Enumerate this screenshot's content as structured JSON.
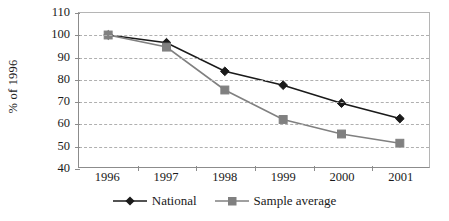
{
  "chart_data": {
    "type": "line",
    "title": "",
    "xlabel": "",
    "ylabel": "% of 1996",
    "categories": [
      "1996",
      "1997",
      "1998",
      "1999",
      "2000",
      "2001"
    ],
    "ylim": [
      40,
      110
    ],
    "ytick_step": 10,
    "yticks": [
      "110",
      "100",
      "90",
      "80",
      "70",
      "60",
      "50",
      "40"
    ],
    "grid": true,
    "legend_position": "bottom",
    "series": [
      {
        "name": "National",
        "marker": "diamond",
        "color": "#1a1a1a",
        "values": [
          100,
          96.5,
          83.5,
          77.2,
          69,
          62
        ]
      },
      {
        "name": "Sample average",
        "marker": "square",
        "color": "#808080",
        "values": [
          100,
          94.5,
          75,
          61.6,
          55,
          50.8
        ]
      }
    ]
  },
  "legend": {
    "items": [
      {
        "label": "National",
        "marker": "diamond-marker",
        "color": "#1a1a1a"
      },
      {
        "label": "Sample average",
        "marker": "square-marker",
        "color": "#808080"
      }
    ]
  },
  "colors": {
    "axis": "#8c8c8c",
    "grid": "#b0b0b0",
    "national": "#1a1a1a",
    "sample_average": "#808080",
    "background": "#ffffff"
  }
}
